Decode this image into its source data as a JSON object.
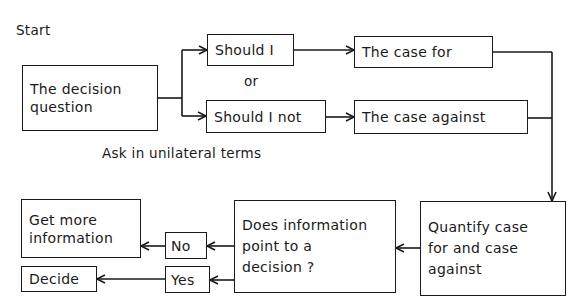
{
  "diagram": {
    "start_label": "Start",
    "nodes": {
      "decision_question": "The decision\nquestion",
      "should_i": "Should I",
      "or_label": "or",
      "should_i_not": "Should I not",
      "case_for": "The case for",
      "case_against": "The case against",
      "ask_note": "Ask in unilateral terms",
      "quantify": "Quantify case\nfor and case\nagainst",
      "does_information": "Does information\npoint to a\ndecision ?",
      "no": "No",
      "yes": "Yes",
      "get_more_info": "Get more\ninformation",
      "decide": "Decide"
    },
    "colors": {
      "line": "#1a1a1a",
      "background": "#ffffff"
    }
  }
}
